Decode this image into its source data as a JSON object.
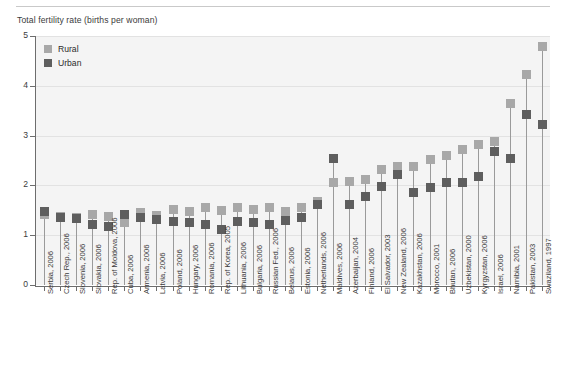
{
  "header": {
    "axis_title": "Total fertility rate (births per woman)"
  },
  "legend": {
    "position": "top-left",
    "items": [
      {
        "label": "Rural",
        "color": "#a8a8a8",
        "name": "legend-rural"
      },
      {
        "label": "Urban",
        "color": "#5e5e5e",
        "name": "legend-urban"
      }
    ]
  },
  "chart_data": {
    "type": "scatter",
    "title": "",
    "subtitle": "",
    "xlabel": "",
    "ylabel": "Total fertility rate (births per woman)",
    "ylim": [
      0,
      5
    ],
    "ytick_labels": [
      "0",
      "1",
      "2",
      "3",
      "4",
      "5"
    ],
    "ytick_values": [
      0,
      1,
      2,
      3,
      4,
      5
    ],
    "grid": true,
    "grid_axis": "y",
    "legend_position": "top-left",
    "categories": [
      "Serbia, 2006",
      "Czech Rep., 2006",
      "Slovenia, 2006",
      "Slovakia, 2006",
      "Rep. of Moldova, 2006",
      "Cuba, 2006",
      "Armenia, 2006",
      "Latvia, 2006",
      "Poland, 2006",
      "Hungary, 2006",
      "Romania, 2006",
      "Rep. of Korea, 2005",
      "Lithuania, 2006",
      "Bulgaria, 2006",
      "Russian Fed., 2006",
      "Belarus, 2006",
      "Estonia, 2006",
      "Netherlands, 2006",
      "Maldives, 2006",
      "Azerbaijan, 2004",
      "Finland, 2006",
      "El Salvador, 2003",
      "New Zealand, 2006",
      "Kazakhstan, 2006",
      "Morocco, 2001",
      "Bhutan, 2006",
      "Uzbekistan, 2000",
      "Kyrgyzstan, 2006",
      "Israel, 2006",
      "Namibia, 2001",
      "Pakistan, 2003",
      "Swaziland, 1997"
    ],
    "series": [
      {
        "name": "Rural",
        "color": "#a8a8a8",
        "values": [
          1.42,
          1.38,
          1.35,
          1.42,
          1.38,
          1.25,
          1.45,
          1.4,
          1.52,
          1.48,
          1.55,
          1.5,
          1.55,
          1.52,
          1.55,
          1.48,
          1.55,
          1.68,
          2.05,
          2.08,
          2.12,
          2.32,
          2.38,
          2.38,
          2.52,
          2.6,
          2.72,
          2.82,
          2.88,
          3.65,
          4.22,
          4.78
        ]
      },
      {
        "name": "Urban",
        "color": "#5e5e5e",
        "values": [
          1.48,
          1.35,
          1.33,
          1.22,
          1.18,
          1.42,
          1.35,
          1.32,
          1.28,
          1.25,
          1.22,
          1.12,
          1.28,
          1.25,
          1.22,
          1.3,
          1.35,
          1.62,
          2.55,
          1.62,
          1.78,
          1.98,
          2.22,
          1.85,
          1.95,
          2.05,
          2.05,
          2.18,
          2.68,
          2.55,
          3.42,
          3.22
        ]
      }
    ]
  }
}
